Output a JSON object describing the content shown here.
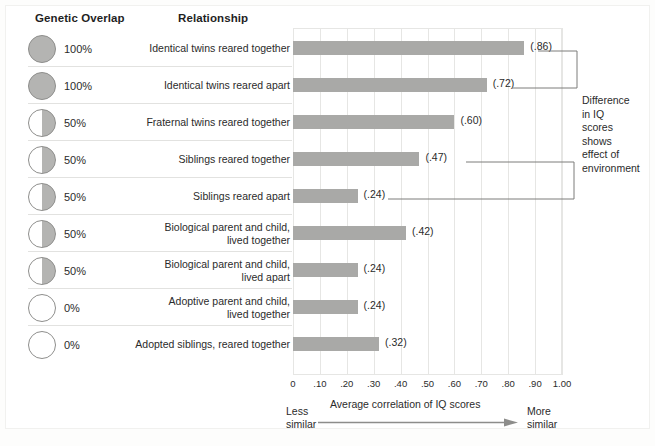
{
  "headers": {
    "genetic_overlap": "Genetic Overlap",
    "relationship": "Relationship"
  },
  "annotation": {
    "text": "Difference in IQ scores shows effect of environment",
    "lines": [
      "Difference",
      "in IQ",
      "scores",
      "shows",
      "effect of",
      "environment"
    ]
  },
  "axis": {
    "caption": "Average correlation of IQ scores",
    "less_similar": "Less similar",
    "less_similar_lines": [
      "Less",
      "similar"
    ],
    "more_similar": "More similar",
    "more_similar_lines": [
      "More",
      "similar"
    ],
    "ticks": [
      "0",
      ".10",
      ".20",
      ".30",
      ".40",
      ".50",
      ".60",
      ".70",
      ".80",
      ".90",
      "1.00"
    ]
  },
  "colors": {
    "bar": "#a9a9a7",
    "pie_fill": "#b4b4b2",
    "grid": "#e6e6e4",
    "text": "#2b2b2b"
  },
  "chart_data": {
    "type": "bar",
    "title": "",
    "xlabel": "Average correlation of IQ scores",
    "ylabel": "Relationship",
    "xlim": [
      0,
      1.0
    ],
    "grid": true,
    "orientation": "horizontal",
    "legend": "none",
    "categories": [
      "Identical twins reared together",
      "Identical twins reared apart",
      "Fraternal twins reared together",
      "Siblings reared together",
      "Siblings reared apart",
      "Biological parent and child, lived together",
      "Biological parent and child, lived apart",
      "Adoptive parent and child, lived together",
      "Adopted siblings, reared together"
    ],
    "values": [
      0.86,
      0.72,
      0.6,
      0.47,
      0.24,
      0.42,
      0.24,
      0.24,
      0.32
    ],
    "value_labels": [
      "(.86)",
      "(.72)",
      "(.60)",
      "(.47)",
      "(.24)",
      "(.42)",
      "(.24)",
      "(.24)",
      "(.32)"
    ],
    "genetic_overlap": [
      "100%",
      "100%",
      "50%",
      "50%",
      "50%",
      "50%",
      "50%",
      "0%",
      "0%"
    ],
    "genetic_overlap_values": [
      100,
      100,
      50,
      50,
      50,
      50,
      50,
      0,
      0
    ]
  },
  "rows": [
    {
      "overlap": "100%",
      "overlap_value": 100,
      "pie": "full",
      "label_lines": [
        "Identical twins reared together"
      ],
      "value": 0.86,
      "value_label": "(.86)"
    },
    {
      "overlap": "100%",
      "overlap_value": 100,
      "pie": "full",
      "label_lines": [
        "Identical twins reared apart"
      ],
      "value": 0.72,
      "value_label": "(.72)"
    },
    {
      "overlap": "50%",
      "overlap_value": 50,
      "pie": "half",
      "label_lines": [
        "Fraternal twins reared together"
      ],
      "value": 0.6,
      "value_label": "(.60)"
    },
    {
      "overlap": "50%",
      "overlap_value": 50,
      "pie": "half",
      "label_lines": [
        "Siblings reared together"
      ],
      "value": 0.47,
      "value_label": "(.47)"
    },
    {
      "overlap": "50%",
      "overlap_value": 50,
      "pie": "half",
      "label_lines": [
        "Siblings reared apart"
      ],
      "value": 0.24,
      "value_label": "(.24)"
    },
    {
      "overlap": "50%",
      "overlap_value": 50,
      "pie": "half",
      "label_lines": [
        "Biological parent and child,",
        "lived together"
      ],
      "value": 0.42,
      "value_label": "(.42)"
    },
    {
      "overlap": "50%",
      "overlap_value": 50,
      "pie": "half",
      "label_lines": [
        "Biological parent and child,",
        "lived apart"
      ],
      "value": 0.24,
      "value_label": "(.24)"
    },
    {
      "overlap": "0%",
      "overlap_value": 0,
      "pie": "empty",
      "label_lines": [
        "Adoptive parent and child,",
        "lived together"
      ],
      "value": 0.24,
      "value_label": "(.24)"
    },
    {
      "overlap": "0%",
      "overlap_value": 0,
      "pie": "empty",
      "label_lines": [
        "Adopted siblings, reared together"
      ],
      "value": 0.32,
      "value_label": "(.32)"
    }
  ]
}
